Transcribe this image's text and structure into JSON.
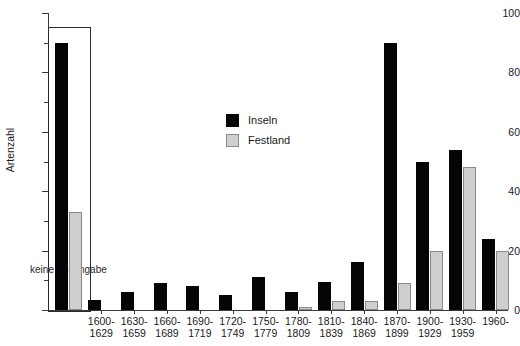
{
  "chart_data": {
    "type": "bar",
    "title": "",
    "xlabel": "",
    "ylabel": "Artenzahl",
    "ylim": [
      0,
      100
    ],
    "yticks": [
      0,
      20,
      40,
      60,
      80,
      100
    ],
    "ytick_labels": [
      "0",
      "20",
      "40",
      "60",
      "80",
      "100"
    ],
    "yminor_ticks": [
      10,
      30,
      50,
      70,
      90
    ],
    "grid": false,
    "legend_position": "upper center",
    "categories": [
      "1600-\n1629",
      "1630-\n1659",
      "1660-\n1689",
      "1690-\n1719",
      "1720-\n1749",
      "1750-\n1779",
      "1780-\n1809",
      "1810-\n1839",
      "1840-\n1869",
      "1870-\n1899",
      "1900-\n1929",
      "1930-\n1959",
      "1960-"
    ],
    "category_lines": [
      [
        "1600-",
        "1629"
      ],
      [
        "1630-",
        "1659"
      ],
      [
        "1660-",
        "1689"
      ],
      [
        "1690-",
        "1719"
      ],
      [
        "1720-",
        "1749"
      ],
      [
        "1750-",
        "1779"
      ],
      [
        "1780-",
        "1809"
      ],
      [
        "1810-",
        "1839"
      ],
      [
        "1840-",
        "1869"
      ],
      [
        "1870-",
        "1899"
      ],
      [
        "1900-",
        "1929"
      ],
      [
        "1930-",
        "1959"
      ],
      [
        "1960-",
        ""
      ]
    ],
    "series": [
      {
        "name": "Inseln",
        "color": "#050505",
        "values": [
          3.5,
          6,
          9,
          8,
          5,
          11,
          6,
          9.5,
          16,
          90,
          50,
          54,
          24
        ]
      },
      {
        "name": "Festland",
        "color": "#cfcfcf",
        "values": [
          0,
          0,
          0,
          0,
          0,
          0,
          1,
          3,
          3,
          9,
          20,
          48,
          20
        ]
      }
    ],
    "inset": {
      "caption": "keine Zeitangabe",
      "series": [
        {
          "name": "Inseln",
          "color": "#050505",
          "value": 90
        },
        {
          "name": "Festland",
          "color": "#cfcfcf",
          "value": 33
        }
      ]
    }
  },
  "legend": {
    "items": [
      {
        "label": "Inseln",
        "color": "#050505"
      },
      {
        "label": "Festland",
        "color": "#cfcfcf"
      }
    ]
  },
  "caption": {
    "text": ""
  }
}
